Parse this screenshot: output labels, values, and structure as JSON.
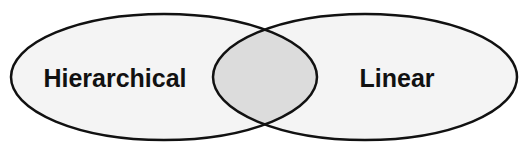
{
  "diagram": {
    "type": "venn",
    "sets": [
      {
        "id": "left",
        "label": "Hierarchical"
      },
      {
        "id": "right",
        "label": "Linear"
      }
    ],
    "intersection": {
      "label": ""
    },
    "colors": {
      "set_fill": "#f4f4f4",
      "intersection_fill": "#dcdcdc",
      "stroke": "#111111",
      "text": "#111111"
    }
  }
}
